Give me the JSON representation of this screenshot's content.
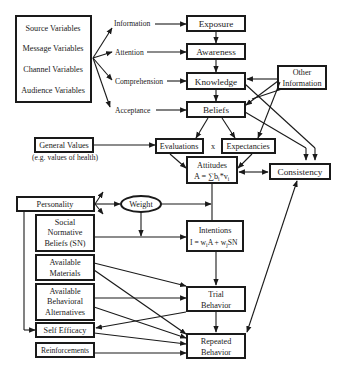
{
  "diagram": {
    "type": "communication-persuasion model flowchart",
    "input_variables": [
      "Source Variables",
      "Message Variables",
      "Channel Variables",
      "Audience Variables"
    ],
    "process_labels": [
      "Information",
      "Attention",
      "Comprehension",
      "Acceptance"
    ],
    "stages": {
      "exposure": "Exposure",
      "awareness": "Awareness",
      "knowledge": "Knowledge",
      "beliefs": "Beliefs",
      "other_information_1": "Other",
      "other_information_2": "Information",
      "general_values": "General Values",
      "general_values_note": "(e.g. values of health)",
      "evaluations": "Evaluations",
      "times": "x",
      "expectancies": "Expectancies",
      "attitudes": "Attitudes",
      "attitudes_formula": "A = ∑b",
      "attitudes_formula_sub1": "i",
      "attitudes_formula_mid": "*v",
      "attitudes_formula_sub2": "i",
      "consistency": "Consistency",
      "personality": "Personality",
      "weight": "Weight",
      "social_1": "Social",
      "social_2": "Normative",
      "social_3": "Beliefs (SN)",
      "intentions": "Intentions",
      "intentions_formula_a": "I = w",
      "intentions_formula_sub1": "i",
      "intentions_formula_b": "A + w",
      "intentions_formula_sub2": "j",
      "intentions_formula_c": "SN",
      "materials_1": "Available",
      "materials_2": "Materials",
      "alternatives_1": "Available",
      "alternatives_2": "Behavioral",
      "alternatives_3": "Alternatives",
      "trial_1": "Trial",
      "trial_2": "Behavior",
      "self_efficacy": "Self Efficacy",
      "reinforcements": "Reinforcements",
      "repeated_1": "Repeated",
      "repeated_2": "Behavior"
    }
  }
}
